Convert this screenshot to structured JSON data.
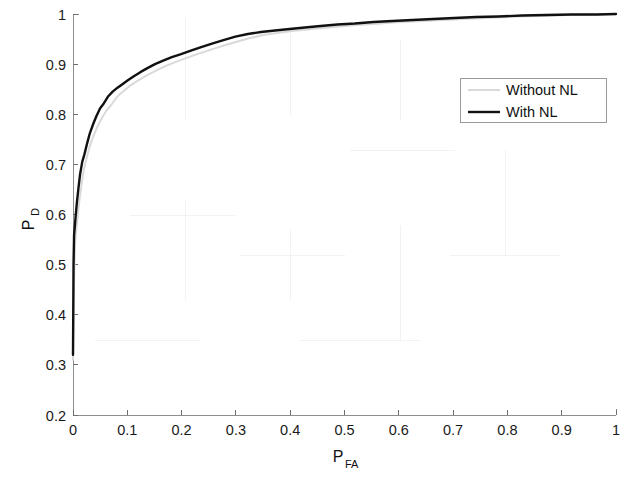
{
  "chart_data": {
    "type": "line",
    "title": "",
    "subtitle": "",
    "xlabel": "P_FA",
    "xlabel_main": "P",
    "xlabel_sub": "FA",
    "ylabel": "P_D",
    "ylabel_main": "P",
    "ylabel_sub": "D",
    "xlim": [
      0,
      1
    ],
    "ylim": [
      0.2,
      1
    ],
    "grid": false,
    "legend_position": "upper right",
    "xticks": [
      0,
      0.1,
      0.2,
      0.3,
      0.4,
      0.5,
      0.6,
      0.7,
      0.8,
      0.9,
      1
    ],
    "xtick_labels": [
      "0",
      "0.1",
      "0.2",
      "0.3",
      "0.4",
      "0.5",
      "0.6",
      "0.7",
      "0.8",
      "0.9",
      "1"
    ],
    "yticks": [
      0.2,
      0.3,
      0.4,
      0.5,
      0.6,
      0.7,
      0.8,
      0.9,
      1
    ],
    "ytick_labels": [
      "0.2",
      "0.3",
      "0.4",
      "0.5",
      "0.6",
      "0.7",
      "0.8",
      "0.9",
      "1"
    ],
    "series": [
      {
        "name": "Without NL",
        "color": "#d9d9d9",
        "linewidth": 2.0,
        "x": [
          0.0,
          0.002,
          0.004,
          0.006,
          0.009,
          0.012,
          0.016,
          0.02,
          0.025,
          0.03,
          0.036,
          0.042,
          0.048,
          0.055,
          0.062,
          0.07,
          0.078,
          0.086,
          0.095,
          0.104,
          0.115,
          0.127,
          0.14,
          0.155,
          0.17,
          0.186,
          0.203,
          0.221,
          0.24,
          0.26,
          0.281,
          0.303,
          0.326,
          0.35,
          0.376,
          0.403,
          0.431,
          0.46,
          0.49,
          0.522,
          0.555,
          0.59,
          0.626,
          0.663,
          0.701,
          0.74,
          0.78,
          0.822,
          0.865,
          0.91,
          0.955,
          1.0
        ],
        "y": [
          0.31,
          0.47,
          0.545,
          0.57,
          0.6,
          0.63,
          0.662,
          0.69,
          0.712,
          0.733,
          0.752,
          0.768,
          0.782,
          0.796,
          0.808,
          0.818,
          0.83,
          0.84,
          0.848,
          0.856,
          0.864,
          0.872,
          0.88,
          0.888,
          0.896,
          0.903,
          0.91,
          0.917,
          0.924,
          0.931,
          0.938,
          0.945,
          0.952,
          0.958,
          0.962,
          0.966,
          0.969,
          0.972,
          0.975,
          0.978,
          0.98,
          0.983,
          0.985,
          0.987,
          0.989,
          0.991,
          0.993,
          0.995,
          0.996,
          0.998,
          0.999,
          1.0
        ]
      },
      {
        "name": "With NL",
        "color": "#111111",
        "linewidth": 2.4,
        "x": [
          0.0,
          0.001,
          0.002,
          0.003,
          0.005,
          0.007,
          0.01,
          0.013,
          0.017,
          0.021,
          0.026,
          0.031,
          0.037,
          0.043,
          0.05,
          0.057,
          0.065,
          0.073,
          0.082,
          0.091,
          0.101,
          0.112,
          0.124,
          0.137,
          0.151,
          0.166,
          0.182,
          0.199,
          0.217,
          0.236,
          0.256,
          0.277,
          0.299,
          0.322,
          0.346,
          0.372,
          0.399,
          0.427,
          0.456,
          0.487,
          0.519,
          0.553,
          0.588,
          0.625,
          0.663,
          0.702,
          0.742,
          0.784,
          0.827,
          0.872,
          0.918,
          0.965,
          1.0
        ],
        "y": [
          0.32,
          0.5,
          0.56,
          0.572,
          0.598,
          0.622,
          0.652,
          0.68,
          0.705,
          0.72,
          0.742,
          0.762,
          0.78,
          0.796,
          0.812,
          0.822,
          0.836,
          0.845,
          0.853,
          0.86,
          0.868,
          0.876,
          0.884,
          0.892,
          0.9,
          0.907,
          0.914,
          0.92,
          0.927,
          0.934,
          0.941,
          0.948,
          0.955,
          0.96,
          0.964,
          0.967,
          0.97,
          0.973,
          0.976,
          0.979,
          0.981,
          0.984,
          0.986,
          0.988,
          0.99,
          0.992,
          0.994,
          0.995,
          0.997,
          0.998,
          0.999,
          0.999,
          1.0
        ]
      }
    ],
    "annotations": []
  },
  "legend": {
    "entries": [
      {
        "label": "Without NL",
        "swatch": "line-swatch-light"
      },
      {
        "label": "With NL",
        "swatch": "line-swatch-dark"
      }
    ]
  },
  "colors": {
    "background": "#ffffff",
    "axis": "#8e8e8e",
    "text": "#111111",
    "series_with_nl": "#111111",
    "series_without_nl": "#d9d9d9"
  }
}
